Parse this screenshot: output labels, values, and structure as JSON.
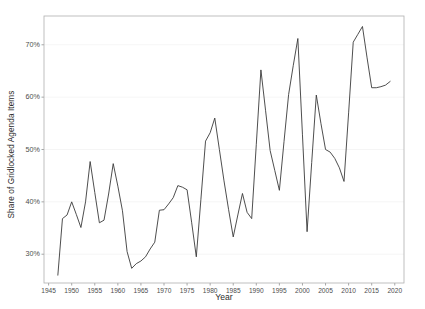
{
  "chart_data": {
    "type": "line",
    "title": "",
    "xlabel": "Year",
    "ylabel": "Share of Gridlocked Agenda Items",
    "xlim": [
      1944,
      2022
    ],
    "ylim": [
      24.5,
      75.5
    ],
    "grid": "horizontal",
    "legend": "none",
    "line_color": "#3a3a3a",
    "panel_border_color": "#b0b0b0",
    "gridline_color": "#f2f2f2",
    "x_ticks": [
      1945,
      1950,
      1955,
      1960,
      1965,
      1970,
      1975,
      1980,
      1985,
      1990,
      1995,
      2000,
      2005,
      2010,
      2015,
      2020
    ],
    "x_tick_labels": [
      "1945",
      "1950",
      "1955",
      "1960",
      "1965",
      "1970",
      "1975",
      "1980",
      "1985",
      "1990",
      "1995",
      "2000",
      "2005",
      "2010",
      "2015",
      "2020"
    ],
    "y_ticks": [
      30,
      40,
      50,
      60,
      70
    ],
    "y_tick_labels": [
      "30%",
      "40%",
      "50%",
      "60%",
      "70%"
    ],
    "x": [
      1947,
      1948,
      1949,
      1950,
      1951,
      1952,
      1953,
      1954,
      1955,
      1956,
      1957,
      1958,
      1959,
      1960,
      1961,
      1962,
      1963,
      1964,
      1965,
      1966,
      1967,
      1968,
      1969,
      1970,
      1971,
      1972,
      1973,
      1974,
      1975,
      1976,
      1977,
      1978,
      1979,
      1980,
      1981,
      1982,
      1983,
      1984,
      1985,
      1986,
      1987,
      1988,
      1989,
      1990,
      1991,
      1992,
      1993,
      1994,
      1995,
      1996,
      1997,
      1998,
      1999,
      2000,
      2001,
      2002,
      2003,
      2004,
      2005,
      2006,
      2007,
      2008,
      2009,
      2010,
      2011,
      2012,
      2013,
      2014,
      2015,
      2016,
      2017,
      2018,
      2019
    ],
    "values": [
      26.0,
      36.8,
      37.5,
      40.0,
      37.6,
      35.1,
      40.0,
      47.7,
      41.8,
      36.0,
      36.5,
      41.5,
      47.3,
      43.0,
      38.3,
      30.5,
      27.3,
      28.2,
      28.7,
      29.5,
      31.0,
      32.3,
      38.4,
      38.5,
      39.6,
      40.8,
      43.1,
      42.8,
      42.3,
      36.0,
      29.5,
      40.5,
      51.6,
      53.2,
      56.0,
      50.0,
      44.0,
      38.5,
      33.3,
      37.5,
      41.6,
      38.0,
      36.8,
      51.0,
      65.2,
      57.5,
      49.8,
      46.0,
      42.2,
      51.5,
      60.5,
      66.0,
      71.2,
      52.8,
      34.3,
      47.5,
      60.4,
      55.0,
      50.0,
      49.5,
      48.3,
      46.5,
      43.9,
      57.0,
      70.5,
      72.0,
      73.5,
      67.5,
      61.8,
      61.8,
      62.0,
      62.3,
      63.0
    ],
    "axis_tick_color": "#808080"
  }
}
